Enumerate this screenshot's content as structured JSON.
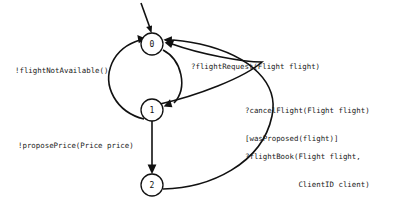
{
  "diagram": {
    "kind": "state-machine",
    "background_color": "#ffffff",
    "stroke_color": "#111111",
    "states": [
      {
        "id": "0",
        "label": "0",
        "cx": 152,
        "cy": 44,
        "r": 11
      },
      {
        "id": "1",
        "label": "1",
        "cx": 152,
        "cy": 110,
        "r": 11
      },
      {
        "id": "2",
        "label": "2",
        "cx": 152,
        "cy": 185,
        "r": 11
      }
    ],
    "initial_marker": {
      "name": "initial-state-arrow",
      "from_x": 142,
      "from_y": 4,
      "to_x": 151,
      "to_y": 31
    },
    "transitions": [
      {
        "id": "flight-not-available",
        "from": "1",
        "to": "0",
        "label": "!flightNotAvailable()",
        "lines": [
          "!flightNotAvailable()"
        ],
        "side": "left"
      },
      {
        "id": "propose-price",
        "from": "1",
        "to": "2",
        "label": "!proposePrice(Price price)",
        "lines": [
          "!proposePrice(Price price)"
        ],
        "side": "left"
      },
      {
        "id": "flight-request",
        "from": "0",
        "to": "1",
        "label": "?flightRequest(Flight flight)",
        "lines": [
          "?flightRequest(Flight flight)"
        ],
        "side": "right"
      },
      {
        "id": "cancel-flight",
        "from": "1",
        "to": "0",
        "label": "?cancelFlight(Flight flight) [wasProposed(flight)]",
        "lines": [
          "?cancelFlight(Flight flight)",
          "[wasProposed(flight)]"
        ],
        "side": "right"
      },
      {
        "id": "flight-book",
        "from": "2",
        "to": "0",
        "label": "?flightBook(Flight flight, ClientID client) [wasProposed(Flight)]",
        "lines": [
          "?flightBook(Flight flight,",
          "            ClientID client)",
          "  [wasProposed(Flight)]"
        ],
        "side": "right"
      }
    ]
  },
  "labels": {
    "flight_not_available": "!flightNotAvailable()",
    "propose_price": "!proposePrice(Price price)",
    "flight_request": "?flightRequest(Flight flight)",
    "cancel_flight_line1": "?cancelFlight(Flight flight)",
    "cancel_flight_line2": "[wasProposed(flight)]",
    "flight_book_line1": "?flightBook(Flight flight,",
    "flight_book_line2": "            ClientID client)",
    "flight_book_line3": "  [wasProposed(Flight)]",
    "state0": "0",
    "state1": "1",
    "state2": "2"
  }
}
